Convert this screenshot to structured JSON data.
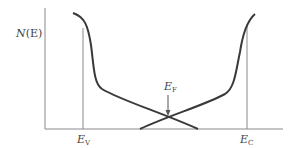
{
  "diagram": {
    "y_axis_label": "N(E)",
    "y_axis_label_main": "N",
    "y_axis_label_arg": "(E)",
    "markers": [
      {
        "name": "valence band edge",
        "symbol": "E",
        "subscript": "V"
      },
      {
        "name": "conduction band edge",
        "symbol": "E",
        "subscript": "C"
      },
      {
        "name": "Fermi level",
        "symbol": "E",
        "subscript": "F"
      }
    ],
    "colors": {
      "curve": "#3a3a3a",
      "axis": "#8a8a8a",
      "text": "#444444"
    }
  }
}
